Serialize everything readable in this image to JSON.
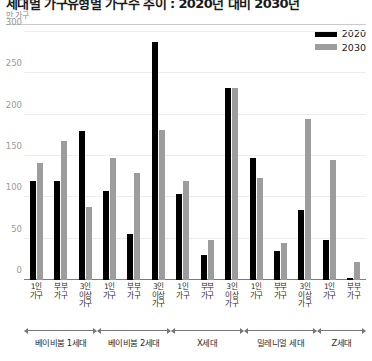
{
  "header": {
    "title": "세대별 가구유형별 가구수 추이 : 2020년 대비 2030년",
    "unit": "만 가구"
  },
  "legend": {
    "position": "top-right",
    "items": [
      {
        "label": "2020",
        "color": "#000000"
      },
      {
        "label": "2030",
        "color": "#9d9d9d"
      }
    ]
  },
  "chart_data": {
    "type": "bar",
    "title": "세대별 가구유형별 가구수 추이 : 2020년 대비 2030년",
    "xlabel": "",
    "ylabel": "만 가구",
    "ylim": [
      0,
      300
    ],
    "yticks": [
      0,
      50,
      100,
      150,
      200,
      250,
      300
    ],
    "grid": true,
    "legend_position": "top-right",
    "categories": [
      "1인 가구",
      "부부 가구",
      "3인 이상 가구",
      "1인 가구",
      "부부 가구",
      "3인 이상 가구",
      "1인 가구",
      "부부 가구",
      "3인 이상 가구",
      "1인 가구",
      "부부 가구",
      "3인 이상 가구",
      "1인 가구",
      "부부 가구"
    ],
    "groups": [
      {
        "name": "베이비붐 1세대",
        "categories": [
          "1인 가구",
          "부부 가구",
          "3인 이상 가구"
        ]
      },
      {
        "name": "베이비붐 2세대",
        "categories": [
          "1인 가구",
          "부부 가구",
          "3인 이상 가구"
        ]
      },
      {
        "name": "X세대",
        "categories": [
          "1인 가구",
          "부부 가구",
          "3인 이상 가구"
        ]
      },
      {
        "name": "밀레니얼 세대",
        "categories": [
          "1인 가구",
          "부부 가구",
          "3인 이상 가구"
        ]
      },
      {
        "name": "Z세대",
        "categories": [
          "1인 가구",
          "부부 가구"
        ]
      }
    ],
    "series": [
      {
        "name": "2020",
        "color": "#000000",
        "values": [
          120,
          120,
          180,
          108,
          56,
          288,
          104,
          30,
          232,
          148,
          35,
          85,
          48,
          2
        ]
      },
      {
        "name": "2030",
        "color": "#9d9d9d",
        "values": [
          142,
          168,
          88,
          147,
          130,
          182,
          120,
          48,
          232,
          124,
          45,
          195,
          145,
          22
        ]
      }
    ]
  }
}
